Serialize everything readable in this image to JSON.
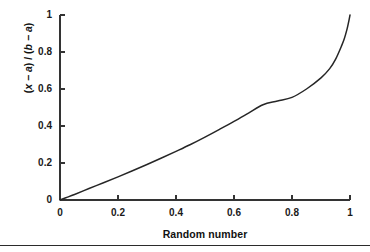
{
  "figure": {
    "background_color": "#ffffff",
    "axis_color": "#333333",
    "curve_color": "#262626",
    "rule_color": "#2b2b2b"
  },
  "axes": {
    "x_title": "Random number",
    "y_title_parts": {
      "open1": "(",
      "x": "x",
      "minus1": " − ",
      "a1": "a",
      "close1": ")",
      "slash": " / ",
      "open2": "(",
      "b": "b",
      "minus2": " − ",
      "a2": "a",
      "close2": ")"
    },
    "y_title_plain": "(x − a) / (b − a)",
    "x_ticks": [
      "0",
      "0.2",
      "0.4",
      "0.6",
      "0.8",
      "1"
    ],
    "y_ticks": [
      "0",
      "0.2",
      "0.4",
      "0.6",
      "0.8",
      "1"
    ]
  },
  "chart_data": {
    "type": "line",
    "title": "",
    "subtitle": "",
    "xlabel": "Random number",
    "ylabel": "(x − a) / (b − a)",
    "xlim": [
      0,
      1
    ],
    "ylim": [
      0,
      1
    ],
    "xticks": [
      0,
      0.2,
      0.4,
      0.6,
      0.8,
      1
    ],
    "yticks": [
      0,
      0.2,
      0.4,
      0.6,
      0.8,
      1
    ],
    "xticklabels": [
      "0",
      "0.2",
      "0.4",
      "0.6",
      "0.8",
      "1"
    ],
    "yticklabels": [
      "0",
      "0.2",
      "0.4",
      "0.6",
      "0.8",
      "1"
    ],
    "grid": false,
    "legend": null,
    "legend_position": "none",
    "annotations": [],
    "series": [
      {
        "name": "(x − a) / (b − a) vs random number",
        "x": [
          0,
          0.02,
          0.05,
          0.1,
          0.15,
          0.2,
          0.25,
          0.3,
          0.35,
          0.4,
          0.45,
          0.5,
          0.55,
          0.6,
          0.65,
          0.7,
          0.75,
          0.8,
          0.85,
          0.9,
          0.93,
          0.95,
          0.97,
          0.98,
          0.99,
          0.995,
          1
        ],
        "y": [
          0,
          0.012,
          0.03,
          0.062,
          0.093,
          0.125,
          0.158,
          0.192,
          0.227,
          0.263,
          0.3,
          0.34,
          0.382,
          0.425,
          0.47,
          0.515,
          0.535,
          0.555,
          0.6,
          0.66,
          0.71,
          0.76,
          0.83,
          0.87,
          0.925,
          0.96,
          1
        ]
      }
    ]
  }
}
